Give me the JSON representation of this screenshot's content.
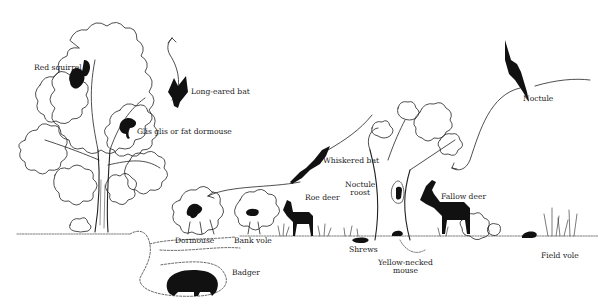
{
  "diagram": {
    "type": "ecological illustration",
    "colors": {
      "ink": "#111111",
      "background": "#ffffff"
    },
    "labels": [
      {
        "id": "red-squirrel",
        "text": "Red squirrel",
        "x": 34,
        "y": 64
      },
      {
        "id": "long-eared-bat",
        "text": "Long-eared bat",
        "x": 191,
        "y": 88
      },
      {
        "id": "glis-glis",
        "text": "Glis glis or fat dormouse",
        "x": 137,
        "y": 128
      },
      {
        "id": "whiskered-bat",
        "text": "Whiskered bat",
        "x": 323,
        "y": 157
      },
      {
        "id": "noctule-roost",
        "text": "Noctule\nroost",
        "x": 345,
        "y": 181
      },
      {
        "id": "roe-deer",
        "text": "Roe deer",
        "x": 305,
        "y": 194
      },
      {
        "id": "fallow-deer",
        "text": "Fallow deer",
        "x": 441,
        "y": 193
      },
      {
        "id": "noctule",
        "text": "Noctule",
        "x": 523,
        "y": 95
      },
      {
        "id": "dormouse",
        "text": "Dormouse",
        "x": 175,
        "y": 237
      },
      {
        "id": "bank-vole",
        "text": "Bank vole",
        "x": 234,
        "y": 237
      },
      {
        "id": "shrews",
        "text": "Shrews",
        "x": 349,
        "y": 246
      },
      {
        "id": "yellow-necked-mouse",
        "text": "Yellow-necked\nmouse",
        "x": 378,
        "y": 259
      },
      {
        "id": "badger",
        "text": "Badger",
        "x": 232,
        "y": 269
      },
      {
        "id": "field-vole",
        "text": "Field vole",
        "x": 541,
        "y": 252
      }
    ]
  }
}
